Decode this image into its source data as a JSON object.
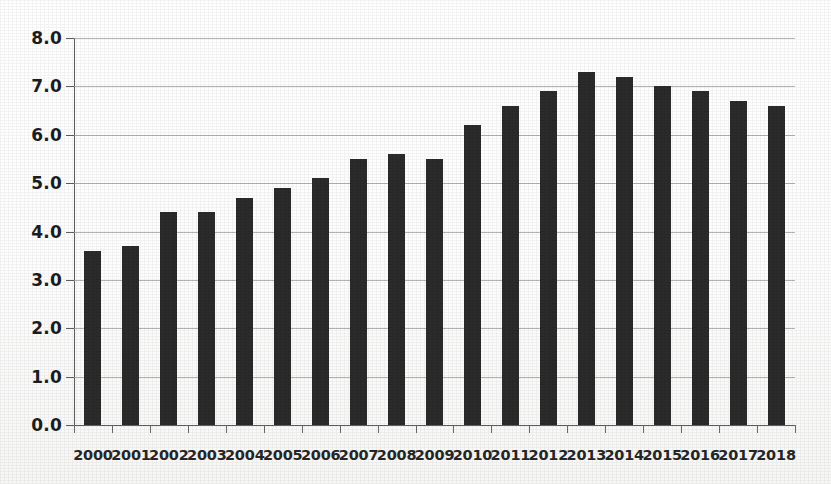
{
  "chart_data": {
    "type": "bar",
    "title": "",
    "subtitle": "",
    "xlabel": "",
    "ylabel": "",
    "ylim": [
      0.0,
      8.0
    ],
    "ytick_step": 1.0,
    "ytick_labels": [
      "8.0",
      "7.0",
      "6.0",
      "5.0",
      "4.0",
      "3.0",
      "2.0",
      "1.0",
      "0.0"
    ],
    "ytick_values": [
      8.0,
      7.0,
      6.0,
      5.0,
      4.0,
      3.0,
      2.0,
      1.0,
      0.0
    ],
    "grid": true,
    "grid_axis": "y",
    "legend": false,
    "legend_position": "none",
    "bar_color": "#2b2b2b",
    "background_color": "#ffffff",
    "gridline_color": "#9a9a9a",
    "axis_color": "#5e5e5e",
    "categories": [
      "2000",
      "2001",
      "2002",
      "2003",
      "2004",
      "2005",
      "2006",
      "2007",
      "2008",
      "2009",
      "2010",
      "2011",
      "2012",
      "2013",
      "2014",
      "2015",
      "2016",
      "2017",
      "2018"
    ],
    "values": [
      3.6,
      3.7,
      4.4,
      4.4,
      4.7,
      4.9,
      5.1,
      5.5,
      5.6,
      5.5,
      6.2,
      6.6,
      6.9,
      7.3,
      7.2,
      7.0,
      6.9,
      6.7,
      6.6
    ]
  }
}
